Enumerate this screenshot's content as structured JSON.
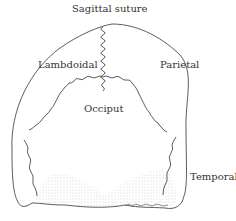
{
  "diagram": {
    "labels": {
      "sagittal": "Sagittal suture",
      "lambdoidal": "Lambdoidal",
      "parietal": "Parietal",
      "occiput": "Occiput",
      "temporal": "Temporal"
    },
    "colors": {
      "line": "#333333",
      "shade": "#bbbbbb",
      "background": "#ffffff"
    }
  }
}
